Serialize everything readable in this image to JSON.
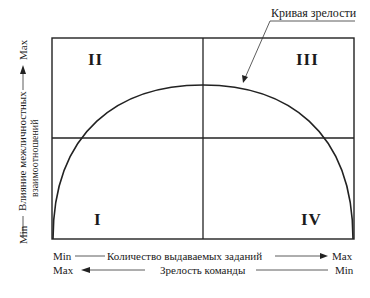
{
  "diagram": {
    "callout_label": "Кривая зрелости",
    "quadrants": {
      "q1": "I",
      "q2": "II",
      "q3": "III",
      "q4": "IV"
    },
    "y_axis": {
      "min": "Min",
      "max": "Max",
      "label_line1": "Влияние межличностных",
      "label_line2": "взаимоотношений"
    },
    "x_axis_1": {
      "left": "Min",
      "label": "Количество выдаваемых заданий",
      "right": "Max",
      "arrow_direction": "right"
    },
    "x_axis_2": {
      "left": "Max",
      "label": "Зрелость команды",
      "right": "Min",
      "arrow_direction": "left"
    }
  }
}
